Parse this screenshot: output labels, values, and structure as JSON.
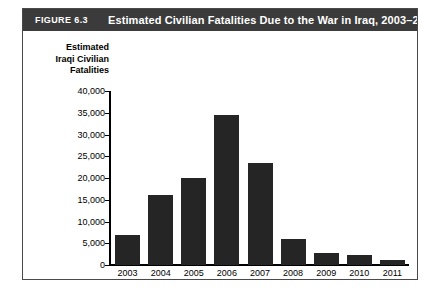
{
  "figure": {
    "number_label": "FIGURE 6.3",
    "title": "Estimated Civilian Fatalities Due to the War in Iraq, 2003–2011",
    "header_bg": "#3b3b3b",
    "header_fg": "#ffffff",
    "border_color": "#4a4a4a",
    "background": "#ffffff"
  },
  "chart_data": {
    "type": "bar",
    "title": "Estimated Civilian Fatalities Due to the War in Iraq, 2003–2011",
    "xlabel": "Year",
    "ylabel": "Estimated Iraqi Civilian Fatalities",
    "ylabel_lines": [
      "Estimated",
      "Iraqi Civilian",
      "Fatalities"
    ],
    "categories": [
      "2003",
      "2004",
      "2005",
      "2006",
      "2007",
      "2008",
      "2009",
      "2010",
      "2011"
    ],
    "values": [
      7000,
      16000,
      20000,
      34500,
      23500,
      6000,
      2700,
      2200,
      1200
    ],
    "ylim": [
      0,
      40000
    ],
    "ytick_values": [
      0,
      5000,
      10000,
      15000,
      20000,
      25000,
      30000,
      35000,
      40000
    ],
    "ytick_labels": [
      "0",
      "5,000",
      "10,000",
      "15,000",
      "20,000",
      "25,000",
      "30,000",
      "35,000",
      "40,000"
    ],
    "grid": false,
    "legend": null,
    "bar_color": "#252525"
  }
}
